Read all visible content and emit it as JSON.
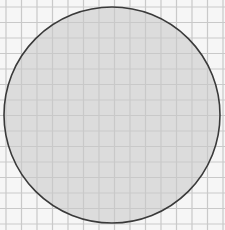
{
  "figure": {
    "background_color": "#f6f6f6",
    "grid": {
      "origin_x": 6,
      "origin_y": 7,
      "cell_size": 15.5,
      "line_color": "#c9c9c9",
      "columns": 14,
      "rows": 14
    },
    "circle": {
      "cx": 112,
      "cy": 115,
      "r": 108,
      "fill_color": "#dcdcdc",
      "stroke_color": "#3a3a3a",
      "stroke_width": 1.6
    }
  }
}
